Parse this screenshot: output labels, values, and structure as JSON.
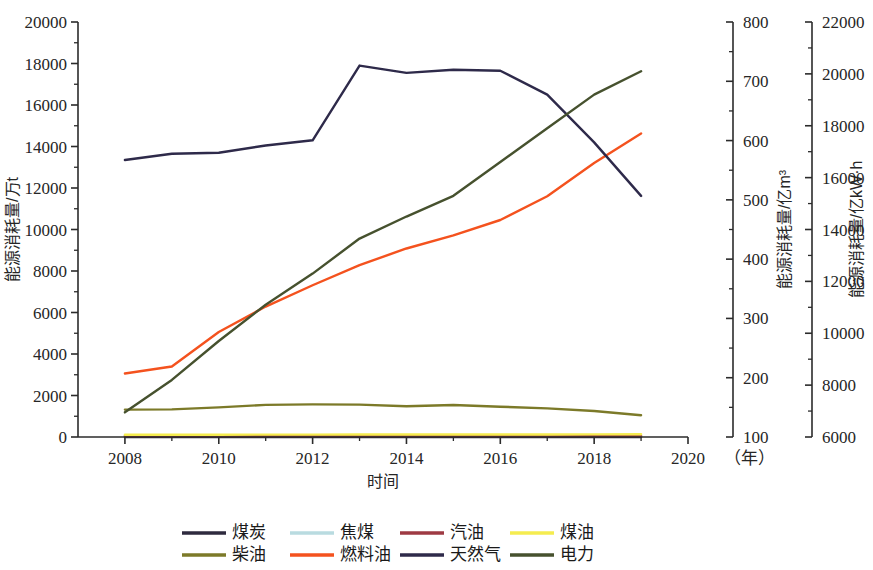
{
  "chart_data": {
    "type": "line",
    "title": "",
    "xlabel": "时间",
    "x_unit_note": "（年）",
    "x": [
      2008,
      2009,
      2010,
      2011,
      2012,
      2013,
      2014,
      2015,
      2016,
      2017,
      2018,
      2019
    ],
    "xlim": [
      2007,
      2020
    ],
    "x_ticks": [
      2008,
      2010,
      2012,
      2014,
      2016,
      2018,
      2020
    ],
    "x_minor_ticks": [
      2009,
      2011,
      2013,
      2015,
      2017,
      2019
    ],
    "grid": false,
    "legend_position": "bottom",
    "axes": [
      {
        "id": "left",
        "label": "能源消耗量/万t",
        "unit": "万t",
        "lim": [
          0,
          20000
        ],
        "ticks": [
          0,
          2000,
          4000,
          6000,
          8000,
          10000,
          12000,
          14000,
          16000,
          18000,
          20000
        ],
        "minor_step": 1000,
        "side": "left"
      },
      {
        "id": "right1",
        "label": "能源消耗量/亿m³",
        "unit": "亿m³",
        "lim": [
          100,
          800
        ],
        "ticks": [
          100,
          200,
          300,
          400,
          500,
          600,
          700,
          800
        ],
        "minor_step": 50,
        "side": "right"
      },
      {
        "id": "right2",
        "label": "能源消耗量/亿kW·h",
        "unit": "亿kW·h",
        "lim": [
          6000,
          22000
        ],
        "ticks": [
          6000,
          8000,
          10000,
          12000,
          14000,
          16000,
          18000,
          20000,
          22000
        ],
        "minor_step": 1000,
        "side": "right"
      }
    ],
    "series": [
      {
        "name": "煤炭",
        "axis": "left",
        "color": "#2e2a3e",
        "values": [
          0,
          0,
          0,
          0,
          0,
          0,
          0,
          0,
          0,
          0,
          0,
          0
        ]
      },
      {
        "name": "焦煤",
        "axis": "left",
        "color": "#b9dbe0",
        "values": [
          60,
          60,
          60,
          60,
          60,
          60,
          60,
          60,
          60,
          60,
          60,
          60
        ]
      },
      {
        "name": "汽油",
        "axis": "left",
        "color": "#9e3a43",
        "values": [
          45,
          45,
          45,
          50,
          50,
          50,
          50,
          50,
          50,
          50,
          50,
          50
        ]
      },
      {
        "name": "煤油",
        "axis": "left",
        "color": "#f5ec4f",
        "values": [
          110,
          110,
          110,
          115,
          115,
          120,
          120,
          120,
          120,
          120,
          125,
          130
        ]
      },
      {
        "name": "柴油",
        "axis": "left",
        "color": "#7c7a29",
        "values": [
          1320,
          1330,
          1430,
          1550,
          1570,
          1560,
          1480,
          1540,
          1460,
          1380,
          1250,
          1050
        ]
      },
      {
        "name": "燃料油",
        "axis": "right1",
        "color": "#f4521e",
        "values": [
          207,
          219,
          277,
          320,
          356,
          390,
          418,
          440,
          466,
          506,
          562,
          612
        ]
      },
      {
        "name": "天然气",
        "axis": "left",
        "color": "#2e2a4a",
        "values": [
          13350,
          13650,
          13700,
          14050,
          14300,
          17900,
          17550,
          17700,
          17650,
          16500,
          14200,
          11620
        ]
      },
      {
        "name": "电力",
        "axis": "right2",
        "color": "#46512e",
        "values": [
          6950,
          8200,
          9700,
          11100,
          12300,
          13650,
          14500,
          15300,
          16600,
          17900,
          19200,
          20100
        ]
      }
    ]
  },
  "legend": {
    "items": [
      {
        "label": "煤炭",
        "color": "#2e2a3e"
      },
      {
        "label": "焦煤",
        "color": "#b9dbe0"
      },
      {
        "label": "汽油",
        "color": "#9e3a43"
      },
      {
        "label": "煤油",
        "color": "#f5ec4f"
      },
      {
        "label": "柴油",
        "color": "#7c7a29"
      },
      {
        "label": "燃料油",
        "color": "#f4521e"
      },
      {
        "label": "天然气",
        "color": "#2e2a4a"
      },
      {
        "label": "电力",
        "color": "#46512e"
      }
    ]
  }
}
